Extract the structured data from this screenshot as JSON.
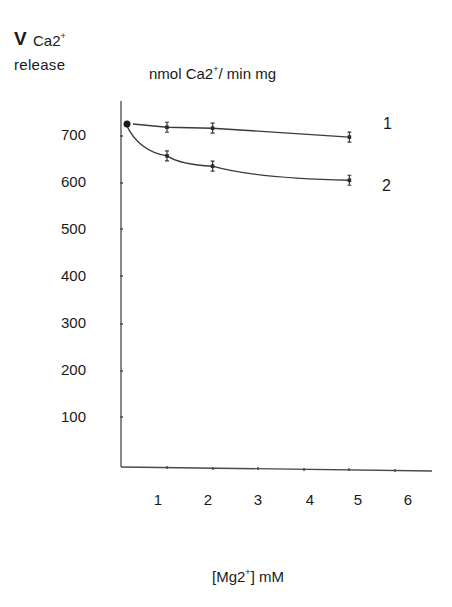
{
  "header": {
    "y_symbol": "V",
    "y_species": "Ca2",
    "y_species_charge": "+",
    "y_word": "release",
    "units_prefix": "nmol Ca2",
    "units_charge": "+",
    "units_suffix": "/ min mg"
  },
  "axes": {
    "x_label_prefix": "[Mg2",
    "x_label_charge": "+",
    "x_label_suffix": "] mM",
    "y_ticks": [
      "700",
      "600",
      "500",
      "400",
      "300",
      "200",
      "100"
    ],
    "x_ticks": [
      "1",
      "2",
      "3",
      "4",
      "5",
      "6"
    ]
  },
  "series_labels": {
    "s1": "1",
    "s2": "2"
  },
  "colors": {
    "line": "#3a3a3a",
    "text": "#1a1a1a",
    "background": "#ffffff"
  },
  "chart_data": {
    "type": "line",
    "title": "",
    "xlabel": "[Mg2+] mM",
    "ylabel": "V Ca2+ release, nmol Ca2+/ min mg",
    "xlim": [
      0,
      6
    ],
    "ylim": [
      0,
      750
    ],
    "x_ticks": [
      1,
      2,
      3,
      4,
      5,
      6
    ],
    "y_ticks": [
      100,
      200,
      300,
      400,
      500,
      600,
      700
    ],
    "grid": false,
    "legend": "inline labels at right of lines",
    "series": [
      {
        "name": "1",
        "x": [
          0.1,
          1,
          2,
          5
        ],
        "values": [
          725,
          718,
          716,
          697
        ],
        "error_bars": true
      },
      {
        "name": "2",
        "x": [
          0.1,
          1,
          2,
          5
        ],
        "values": [
          725,
          657,
          635,
          605
        ],
        "error_bars": true
      }
    ]
  }
}
